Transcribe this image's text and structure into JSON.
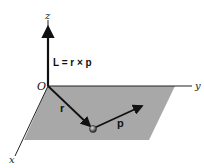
{
  "diagram": {
    "labels": {
      "z_axis": "z",
      "y_axis": "y",
      "x_axis": "x",
      "origin": "O",
      "equation": "L = r × p",
      "position_vector": "r",
      "momentum_vector": "p"
    },
    "colors": {
      "plane": "#a6a6a6",
      "axis": "#1a1a1a",
      "vector": "#111111",
      "particle": "#555555"
    }
  }
}
